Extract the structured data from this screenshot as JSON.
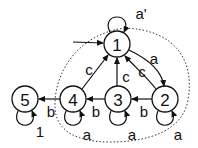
{
  "diagram": {
    "type": "state-machine",
    "start_state": "1",
    "nodes": [
      {
        "id": "1",
        "label": "1",
        "x": 117,
        "y": 44
      },
      {
        "id": "2",
        "label": "2",
        "x": 165,
        "y": 99
      },
      {
        "id": "3",
        "label": "3",
        "x": 118,
        "y": 99
      },
      {
        "id": "4",
        "label": "4",
        "x": 73,
        "y": 99
      },
      {
        "id": "5",
        "label": "5",
        "x": 25,
        "y": 99
      }
    ],
    "edges": [
      {
        "from": "1",
        "to": "1",
        "label": "a'"
      },
      {
        "from": "1",
        "to": "2",
        "label": "a"
      },
      {
        "from": "2",
        "to": "1",
        "label": "c"
      },
      {
        "from": "3",
        "to": "1",
        "label": "c"
      },
      {
        "from": "4",
        "to": "1",
        "label": "c"
      },
      {
        "from": "2",
        "to": "3",
        "label": "b"
      },
      {
        "from": "3",
        "to": "4",
        "label": "b"
      },
      {
        "from": "4",
        "to": "5",
        "label": "b"
      },
      {
        "from": "2",
        "to": "2",
        "label": "a"
      },
      {
        "from": "3",
        "to": "3",
        "label": "a"
      },
      {
        "from": "4",
        "to": "4",
        "label": "a"
      },
      {
        "from": "5",
        "to": "5",
        "label": "1"
      }
    ],
    "region": {
      "style": "dotted",
      "encloses": [
        "1",
        "2",
        "3",
        "4"
      ]
    }
  }
}
